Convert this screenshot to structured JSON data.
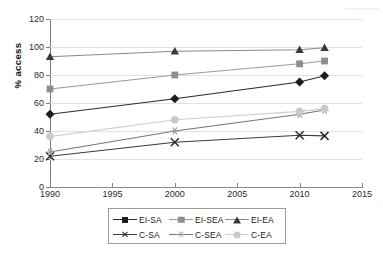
{
  "chart_data": {
    "type": "line",
    "title": "",
    "xlabel": "",
    "ylabel": "% access",
    "x": [
      1990,
      2000,
      2010,
      2012
    ],
    "xlim": [
      1990,
      2015
    ],
    "ylim": [
      0,
      120
    ],
    "xticks": [
      1990,
      1995,
      2000,
      2005,
      2010,
      2015
    ],
    "yticks": [
      0,
      20,
      40,
      60,
      80,
      100,
      120
    ],
    "grid": "horizontal",
    "legend_position": "bottom",
    "series": [
      {
        "name": "EI-SA",
        "marker": "diamond",
        "color": "#1c1c1c",
        "line_color": "#2b2b2b",
        "values": [
          52,
          63,
          75,
          79.5
        ]
      },
      {
        "name": "EI-SEA",
        "marker": "square",
        "color": "#8e8e8e",
        "line_color": "#9a9a9a",
        "values": [
          70,
          80,
          88,
          90
        ]
      },
      {
        "name": "EI-EA",
        "marker": "triangle",
        "color": "#3a3a3a",
        "line_color": "#8a8a8a",
        "values": [
          93,
          97,
          98,
          99.5
        ]
      },
      {
        "name": "C-SA",
        "marker": "x",
        "color": "#2b2b2b",
        "line_color": "#3a3a3a",
        "values": [
          22,
          32,
          37,
          36.5
        ]
      },
      {
        "name": "C-SEA",
        "marker": "star",
        "color": "#9a9a9a",
        "line_color": "#777777",
        "values": [
          25,
          40,
          52,
          55
        ]
      },
      {
        "name": "C-EA",
        "marker": "circle",
        "color": "#c9c9c9",
        "line_color": "#cfcfcf",
        "values": [
          36,
          48,
          54,
          56
        ]
      }
    ]
  },
  "legend": {
    "rows": [
      [
        "EI-SA",
        "EI-SEA",
        "EI-EA"
      ],
      [
        "C-SA",
        "C-SEA",
        "C-EA"
      ]
    ]
  },
  "axis": {
    "y_title": "% access",
    "y_tick_labels": [
      "0",
      "20",
      "40",
      "60",
      "80",
      "100",
      "120"
    ],
    "x_tick_labels": [
      "1990",
      "1995",
      "2000",
      "2005",
      "2010",
      "2015"
    ]
  }
}
